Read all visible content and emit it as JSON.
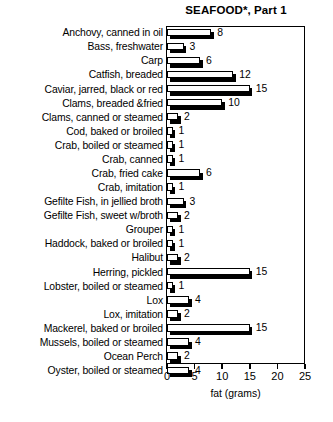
{
  "chart_data": {
    "type": "bar",
    "orientation": "horizontal",
    "title": "SEAFOOD*, Part 1",
    "xlabel": "fat (grams)",
    "ylabel": "",
    "xlim": [
      0,
      25
    ],
    "xticks": [
      0,
      5,
      10,
      15,
      20,
      25
    ],
    "xtick_labels": [
      "0",
      "5",
      "10",
      "15",
      "20",
      "25"
    ],
    "grid": false,
    "legend": null,
    "bar_style": "white-face-with-black-drop-shadow",
    "categories": [
      "Anchovy, canned in oil",
      "Bass, freshwater",
      "Carp",
      "Catfish, breaded",
      "Caviar, jarred, black or red",
      "Clams, breaded &fried",
      "Clams, canned or steamed",
      "Cod, baked or broiled",
      "Crab, boiled or steamed",
      "Crab, canned",
      "Crab, fried cake",
      "Crab, imitation",
      "Gefilte Fish, in jellied broth",
      "Gefilte Fish, sweet w/broth",
      "Grouper",
      "Haddock, baked or broiled",
      "Halibut",
      "Herring, pickled",
      "Lobster,  boiled or steamed",
      "Lox",
      "Lox,  imitation",
      "Mackerel, baked or broiled",
      "Mussels, boiled or steamed",
      "Ocean Perch",
      "Oyster, boiled or steamed"
    ],
    "values": [
      8,
      3,
      6,
      12,
      15,
      10,
      2,
      1,
      1,
      1,
      6,
      1,
      3,
      2,
      1,
      1,
      2,
      15,
      1,
      4,
      2,
      15,
      4,
      2,
      4
    ],
    "value_labels": [
      "8",
      "3",
      "6",
      "12",
      "15",
      "10",
      "2",
      "1",
      "1",
      "1",
      "6",
      "1",
      "3",
      "2",
      "1",
      "1",
      "2",
      "15",
      "1",
      "4",
      "2",
      "15",
      "4",
      "2",
      "4"
    ]
  },
  "colors": {
    "bar_face": "#ffffff",
    "bar_edge": "#000000",
    "bar_shadow": "#000000",
    "background": "#ffffff",
    "text": "#000000"
  }
}
